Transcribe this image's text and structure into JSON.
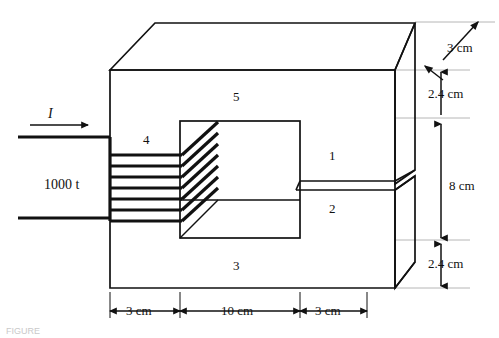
{
  "figure": {
    "kind": "magnetic-core-isometric-diagram",
    "segments": [
      {
        "id": "1",
        "label": "1",
        "x": 332,
        "y": 155
      },
      {
        "id": "2",
        "label": "2",
        "x": 332,
        "y": 208
      },
      {
        "id": "3",
        "label": "3",
        "x": 236,
        "y": 265
      },
      {
        "id": "4",
        "label": "4",
        "x": 146,
        "y": 139
      },
      {
        "id": "5",
        "label": "5",
        "x": 236,
        "y": 96
      }
    ],
    "coil": {
      "turns_label": "1000 t",
      "turns_x": 47,
      "turns_y": 185,
      "current_label": "I",
      "current_x": 50,
      "current_y": 116,
      "turn_count": 7
    },
    "dimensions": {
      "vertical": [
        {
          "label": "3 cm",
          "x": 447,
          "y": 48,
          "style": "leader-arrow"
        },
        {
          "label": "2.4 cm",
          "x": 443,
          "y": 94,
          "style": "double-arrow"
        },
        {
          "label": "8 cm",
          "x": 447,
          "y": 186,
          "style": "double-arrow"
        },
        {
          "label": "2.4 cm",
          "x": 443,
          "y": 264,
          "style": "double-arrow"
        }
      ],
      "horizontal": [
        {
          "label": "3 cm",
          "x": 145,
          "y": 311,
          "style": "double-arrow"
        },
        {
          "label": "10 cm",
          "x": 240,
          "y": 311,
          "style": "double-arrow"
        },
        {
          "label": "3 cm",
          "x": 334,
          "y": 311,
          "style": "double-arrow"
        }
      ]
    },
    "caption": "FIGURE",
    "colors": {
      "ink": "#111111",
      "paper": "#ffffff",
      "thin_rule": "#9a9a9a",
      "caption": "#c9c9c9"
    }
  }
}
